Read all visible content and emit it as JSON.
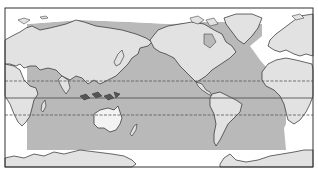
{
  "map": {
    "type": "world-map",
    "projection": "pacific-centered equirectangular",
    "description": "World map centered on the Pacific with a shaded ocean region spanning between approximately 60N and 60S in the Pacific, Indian and Atlantic Oceans",
    "colors": {
      "background": "#ffffff",
      "land": "#e2e2e2",
      "shaded_ocean": "#b9b9b9",
      "unshaded_ocean": "#ffffff",
      "coastline": "#2a2a2a",
      "lines": "#555555",
      "frame": "#333333"
    },
    "reference_lines": [
      {
        "name": "tropic-of-cancer",
        "style": "dashed"
      },
      {
        "name": "equator",
        "style": "solid"
      },
      {
        "name": "tropic-of-capricorn",
        "style": "dashed"
      }
    ],
    "landmasses": [
      "Eurasia",
      "Africa",
      "Australia",
      "North America",
      "South America",
      "Greenland",
      "Antarctica",
      "New Zealand",
      "Japan",
      "Indonesia"
    ]
  }
}
